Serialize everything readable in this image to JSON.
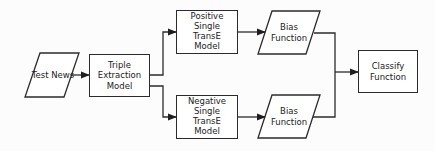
{
  "diagram": {
    "type": "flowchart",
    "nodes": {
      "test_news": {
        "label": "Test News",
        "shape": "parallelogram"
      },
      "triple_extraction": {
        "label": "Triple\nExtraction\nModel",
        "shape": "rectangle"
      },
      "positive_transe": {
        "label": "Positive\nSingle\nTransE\nModel",
        "shape": "rectangle"
      },
      "negative_transe": {
        "label": "Negative\nSingle\nTransE\nModel",
        "shape": "rectangle"
      },
      "bias_top": {
        "label": "Bias\nFunction",
        "shape": "parallelogram"
      },
      "bias_bottom": {
        "label": "Bias\nFunction",
        "shape": "parallelogram"
      },
      "classify": {
        "label": "Classify\nFunction",
        "shape": "rectangle"
      }
    },
    "edges": [
      {
        "from": "Test News",
        "to": "Triple Extraction Model"
      },
      {
        "from": "Triple Extraction Model",
        "to": "Positive Single TransE Model"
      },
      {
        "from": "Triple Extraction Model",
        "to": "Negative Single TransE Model"
      },
      {
        "from": "Positive Single TransE Model",
        "to": "Bias Function (top)"
      },
      {
        "from": "Negative Single TransE Model",
        "to": "Bias Function (bottom)"
      },
      {
        "from": "Bias Function (top)",
        "to": "Classify Function"
      },
      {
        "from": "Bias Function (bottom)",
        "to": "Classify Function"
      }
    ],
    "colors": {
      "stroke": "#2b2b2b",
      "text": "#222222",
      "background": "#ffffff"
    }
  }
}
